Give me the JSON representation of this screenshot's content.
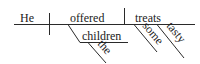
{
  "diagram": {
    "type": "reed-kellogg-sentence-diagram",
    "subject": "He",
    "verb": "offered",
    "direct_object": "treats",
    "indirect_object": "children",
    "modifiers": {
      "children": [
        "the"
      ],
      "treats": [
        "some",
        "tasty"
      ]
    },
    "colors": {
      "line": "#2a2a2a",
      "text": "#1a1a1a",
      "background": "#ffffff"
    }
  }
}
